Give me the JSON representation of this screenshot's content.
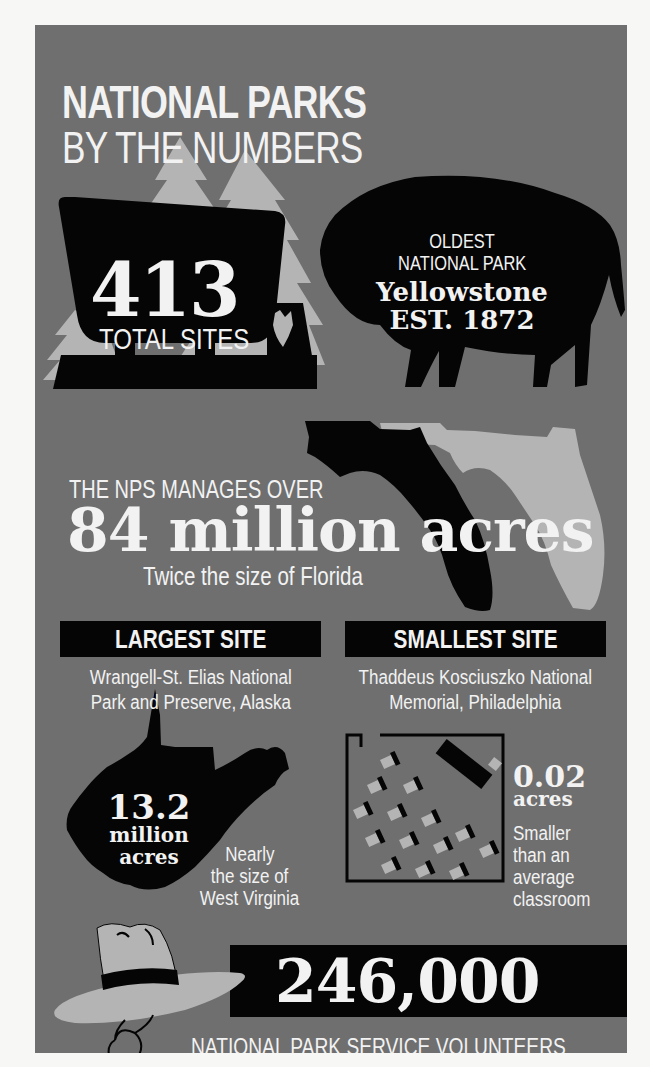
{
  "header": {
    "title_line1": "NATIONAL PARKS",
    "title_line2": "BY THE NUMBERS"
  },
  "total_sites": {
    "number": "413",
    "label": "TOTAL SITES",
    "icons": [
      "pine-tree-icon",
      "park-sign-icon",
      "arrowhead-icon"
    ]
  },
  "oldest_park": {
    "line1": "OLDEST",
    "line2": "NATIONAL PARK",
    "name": "Yellowstone",
    "established": "EST. 1872",
    "icon": "bison-icon"
  },
  "acreage": {
    "intro": "THE NPS MANAGES OVER",
    "amount": "84 million acres",
    "comparison": "Twice the size of Florida",
    "icon": "florida-map-icon"
  },
  "largest_site": {
    "header": "LARGEST SITE",
    "name_line1": "Wrangell-St. Elias National",
    "name_line2": "Park and Preserve, Alaska",
    "number": "13.2",
    "unit_line1": "million",
    "unit_line2": "acres",
    "comparison_line1": "Nearly",
    "comparison_line2": "the size of",
    "comparison_line3": "West Virginia",
    "icon": "west-virginia-map-icon"
  },
  "smallest_site": {
    "header": "SMALLEST SITE",
    "name_line1": "Thaddeus Kosciuszko National",
    "name_line2": "Memorial, Philadelphia",
    "number": "0.02",
    "unit": "acres",
    "comparison_line1": "Smaller",
    "comparison_line2": "than an",
    "comparison_line3": "average",
    "comparison_line4": "classroom",
    "icon": "classroom-icon"
  },
  "volunteers": {
    "number": "246,000",
    "label": "NATIONAL PARK SERVICE VOLUNTEERS",
    "icon": "ranger-hat-icon"
  },
  "colors": {
    "page_background": "#f7f7f5",
    "panel_background": "#6f6f6f",
    "dark": "#050505",
    "light_shape": "#b4b4b4",
    "text": "#f2f2f2"
  }
}
